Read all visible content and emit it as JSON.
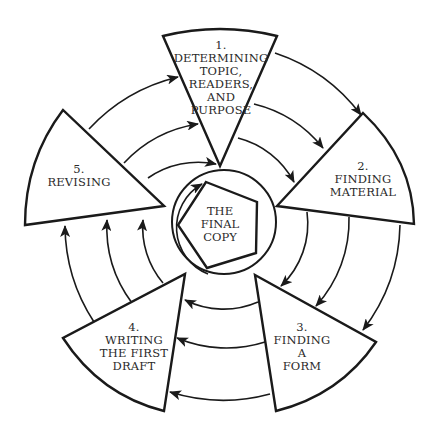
{
  "diagram": {
    "center": {
      "label_lines": [
        "THE",
        "FINAL",
        "COPY"
      ]
    },
    "stages": [
      {
        "number": "1.",
        "lines": [
          "DETERMINING",
          "TOPIC,",
          "READERS,",
          "AND",
          "PURPOSE"
        ]
      },
      {
        "number": "2.",
        "lines": [
          "FINDING",
          "MATERIAL"
        ]
      },
      {
        "number": "3.",
        "lines": [
          "FINDING",
          "A",
          "FORM"
        ]
      },
      {
        "number": "4.",
        "lines": [
          "WRITING",
          "THE FIRST",
          "DRAFT"
        ]
      },
      {
        "number": "5.",
        "lines": [
          "REVISING"
        ]
      }
    ],
    "flow": [
      {
        "from": "1",
        "to": "2",
        "arrows": 3
      },
      {
        "from": "2",
        "to": "3",
        "arrows": 3
      },
      {
        "from": "3",
        "to": "4",
        "arrows": 3
      },
      {
        "from": "4",
        "to": "5",
        "arrows": 3
      },
      {
        "from": "5",
        "to": "1",
        "arrows": 3
      },
      {
        "from": "inner-circle",
        "to": "final-copy",
        "arrows": 1
      }
    ],
    "colors": {
      "line": "#1a1a1a",
      "text": "#2a2a2a",
      "background": "#ffffff"
    }
  }
}
